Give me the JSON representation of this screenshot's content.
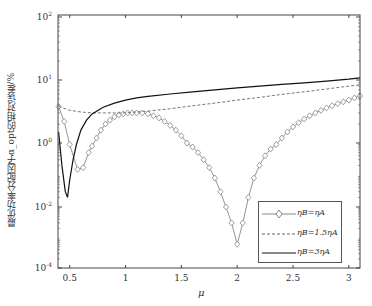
{
  "chart_data": {
    "type": "line",
    "title": "",
    "xlabel": "μ",
    "ylabel": "最优功率分配因子α_opt的相对误差/%",
    "xlim": [
      0.395,
      3.1
    ],
    "yscale": "log",
    "x_ticks": [
      "0.5",
      "1",
      "1.5",
      "2",
      "2.5",
      "3"
    ],
    "y_ticks": [
      {
        "base": "10",
        "exp": "2"
      },
      {
        "base": "10",
        "exp": "1"
      },
      {
        "base": "10",
        "exp": "0"
      },
      {
        "base": "10",
        "exp": "-2"
      },
      {
        "base": "10",
        "exp": "-4"
      }
    ],
    "legend_position": "lower right",
    "grid": false,
    "series": [
      {
        "name": "ηB=ηA",
        "style": "solid-gray-diamond",
        "x": [
          0.4,
          0.45,
          0.5,
          0.57,
          0.62,
          0.67,
          0.7,
          0.74,
          0.78,
          0.82,
          0.86,
          0.9,
          0.94,
          0.98,
          1.02,
          1.06,
          1.1,
          1.15,
          1.2,
          1.25,
          1.3,
          1.35,
          1.4,
          1.45,
          1.5,
          1.55,
          1.6,
          1.65,
          1.7,
          1.75,
          1.8,
          1.85,
          1.9,
          1.95,
          2.0,
          2.05,
          2.1,
          2.15,
          2.2,
          2.25,
          2.3,
          2.35,
          2.4,
          2.45,
          2.5,
          2.55,
          2.6,
          2.65,
          2.7,
          2.75,
          2.8,
          2.85,
          2.9,
          2.95,
          3.0,
          3.05,
          3.1
        ],
        "y": [
          3.8,
          2.2,
          0.9,
          0.15,
          0.17,
          0.5,
          0.8,
          1.2,
          1.6,
          2.0,
          2.3,
          2.6,
          2.8,
          2.9,
          3.0,
          3.0,
          3.0,
          3.0,
          2.9,
          2.7,
          2.5,
          2.2,
          1.9,
          1.6,
          1.3,
          1.0,
          0.75,
          0.5,
          0.3,
          0.17,
          0.08,
          0.03,
          0.01,
          0.003,
          0.0006,
          0.003,
          0.02,
          0.08,
          0.2,
          0.4,
          0.65,
          0.9,
          1.2,
          1.5,
          1.8,
          2.1,
          2.4,
          2.7,
          3.0,
          3.3,
          3.6,
          3.9,
          4.2,
          4.5,
          4.8,
          5.2,
          5.6
        ]
      },
      {
        "name": "ηB=1.5ηA",
        "style": "dashed",
        "x": [
          0.4,
          0.5,
          0.6,
          0.7,
          0.8,
          0.9,
          1.0,
          1.1,
          1.2,
          1.4,
          1.6,
          1.8,
          2.0,
          2.2,
          2.4,
          2.6,
          2.8,
          3.0,
          3.1
        ],
        "y": [
          3.8,
          3.3,
          3.1,
          3.0,
          3.0,
          3.0,
          3.0,
          3.1,
          3.2,
          3.5,
          3.9,
          4.3,
          4.8,
          5.3,
          5.9,
          6.5,
          7.2,
          8.0,
          8.4
        ]
      },
      {
        "name": "ηB=3ηA",
        "style": "solid-black",
        "x": [
          0.4,
          0.43,
          0.46,
          0.48,
          0.5,
          0.53,
          0.56,
          0.6,
          0.65,
          0.7,
          0.8,
          0.9,
          1.0,
          1.1,
          1.2,
          1.4,
          1.6,
          1.8,
          2.0,
          2.2,
          2.4,
          2.6,
          2.8,
          3.0,
          3.1
        ],
        "y": [
          1.5,
          0.2,
          0.03,
          0.02,
          0.07,
          0.3,
          0.9,
          1.6,
          2.3,
          2.9,
          3.7,
          4.3,
          4.8,
          5.2,
          5.5,
          6.0,
          6.5,
          7.0,
          7.5,
          8.0,
          8.5,
          9.0,
          9.6,
          10.3,
          10.8
        ]
      }
    ]
  },
  "legend": {
    "items": [
      {
        "label": "ηB=ηA"
      },
      {
        "label": "ηB=1.5ηA"
      },
      {
        "label": "ηB=3ηA"
      }
    ]
  },
  "axes": {
    "xlabel": "μ",
    "ylabel": "最优功率分配因子α_opt的相对误差/%"
  }
}
